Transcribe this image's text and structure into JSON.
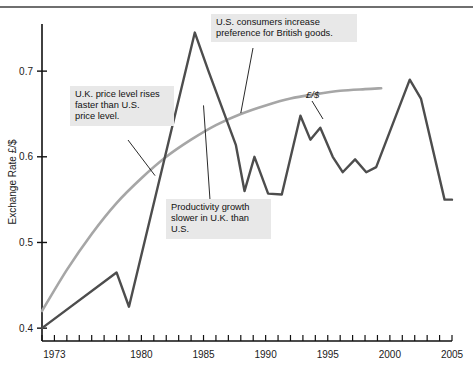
{
  "chart_data": {
    "type": "line",
    "title": "",
    "xlabel": "",
    "ylabel": "Exchange Rate £/$",
    "xlim": [
      1972,
      2005
    ],
    "ylim": [
      0.385,
      0.755
    ],
    "grid": false,
    "legend_position": "inline-label",
    "y_ticks": [
      "0.4",
      "0.5",
      "0.6",
      "0.7"
    ],
    "y_tick_values": [
      0.4,
      0.5,
      0.6,
      0.7
    ],
    "x_ticks": [
      "1973",
      "1980",
      "1985",
      "1990",
      "1995",
      "2000",
      "2005"
    ],
    "x_tick_values": [
      1973,
      1980,
      1985,
      1990,
      1995,
      2000,
      2005
    ],
    "x_minor_tick_step": 1,
    "series": [
      {
        "name": "£/$",
        "label": "£/$",
        "color": "#4d4d4d",
        "x": [
          1972,
          1978,
          1979,
          1984.3,
          1985.4,
          1987.6,
          1988.3,
          1989.1,
          1990.2,
          1991.3,
          1992.8,
          1993.6,
          1994.4,
          1995.4,
          1996.2,
          1997.2,
          1998.1,
          1998.9,
          2001.6,
          2002.5,
          2004.4,
          2005
        ],
        "values": [
          0.4,
          0.465,
          0.425,
          0.745,
          0.7,
          0.614,
          0.56,
          0.6,
          0.557,
          0.556,
          0.648,
          0.62,
          0.634,
          0.6,
          0.582,
          0.597,
          0.582,
          0.588,
          0.69,
          0.668,
          0.55,
          0.55
        ]
      },
      {
        "name": "PPP",
        "label": "",
        "color": "#a6a6a6",
        "x": [
          1972,
          1974,
          1976,
          1978,
          1980,
          1982,
          1984,
          1986,
          1988,
          1990,
          1992,
          1994,
          1996,
          1998,
          1999.3
        ],
        "values": [
          0.42,
          0.468,
          0.51,
          0.546,
          0.575,
          0.6,
          0.62,
          0.637,
          0.65,
          0.66,
          0.668,
          0.673,
          0.677,
          0.679,
          0.68
        ]
      }
    ],
    "annotations": [
      {
        "id": "uk-price-level",
        "text": "U.K. price level rises\nfaster than U.S.\nprice level.",
        "target_x": 1981.1,
        "target_y": 0.578
      },
      {
        "id": "us-consumers",
        "text": "U.S. consumers increase\npreference for British goods.",
        "target_x": 1988.0,
        "target_y": 0.651
      },
      {
        "id": "productivity-growth",
        "text": "Productivity growth\nslower in U.K. than\nU.S.",
        "target_x": 1985.0,
        "target_y": 0.66
      }
    ]
  },
  "axes": {
    "y_title": "Exchange Rate £/$",
    "y_labels": [
      "0.7",
      "0.6",
      "0.5",
      "0.4"
    ],
    "x_labels": [
      "1973",
      "1980",
      "1985",
      "1990",
      "1995",
      "2000",
      "2005"
    ]
  },
  "labels": {
    "series_inline": "£/$"
  },
  "notes": [
    "U.K. price level rises\nfaster than U.S.\nprice level.",
    "U.S. consumers increase\npreference for British goods.",
    "Productivity growth\nslower in U.K. than\nU.S."
  ],
  "colors": {
    "exchange_rate_line": "#4d4d4d",
    "ppp_line": "#a6a6a6",
    "note_background": "#e8e8e8",
    "axis": "#111111",
    "top_rule": "#6f6f6f"
  }
}
